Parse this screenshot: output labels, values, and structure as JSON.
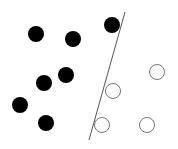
{
  "diagram": {
    "type": "linear-classifier-scatter",
    "width": 178,
    "height": 149,
    "background": "#ffffff",
    "separator": {
      "x1": 125,
      "y1": 12,
      "x2": 89,
      "y2": 140,
      "color": "#555555",
      "width": 1
    },
    "point_radius": 8,
    "classes": [
      {
        "name": "filled",
        "fill": "#000000",
        "stroke": "#000000",
        "points": [
          [
            36,
            34
          ],
          [
            73,
            39
          ],
          [
            112,
            25
          ],
          [
            66,
            75
          ],
          [
            44,
            83
          ],
          [
            20,
            105
          ],
          [
            46,
            123
          ]
        ]
      },
      {
        "name": "hollow",
        "fill": "#ffffff",
        "stroke": "#777777",
        "points": [
          [
            157,
            72
          ],
          [
            113,
            91
          ],
          [
            102,
            125
          ],
          [
            147,
            125
          ]
        ]
      }
    ]
  }
}
